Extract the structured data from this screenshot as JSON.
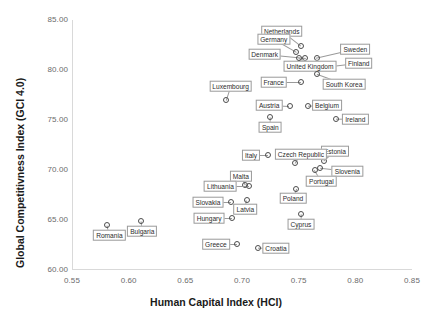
{
  "chart_data": {
    "type": "scatter",
    "title": "",
    "xlabel": "Human Capital Index (HCI)",
    "ylabel": "Global Competitivness Index (GCI 4.0)",
    "xlim": [
      0.55,
      0.85
    ],
    "ylim": [
      60.0,
      85.0
    ],
    "xticks": [
      "0.55",
      "0.60",
      "0.65",
      "0.70",
      "0.75",
      "0.80",
      "0.85"
    ],
    "yticks": [
      "60.00",
      "65.00",
      "70.00",
      "75.00",
      "80.00",
      "85.00"
    ],
    "grid": false,
    "legend": "none",
    "marker": "open-circle",
    "points": [
      {
        "label": "Netherlands",
        "x": 0.752,
        "y": 82.4,
        "lx": 0.735,
        "ly": 83.9
      },
      {
        "label": "Germany",
        "x": 0.748,
        "y": 81.8,
        "lx": 0.728,
        "ly": 83.1
      },
      {
        "label": "Sweden",
        "x": 0.766,
        "y": 81.2,
        "lx": 0.8,
        "ly": 82.1
      },
      {
        "label": "Denmark",
        "x": 0.756,
        "y": 81.2,
        "lx": 0.72,
        "ly": 81.6
      },
      {
        "label": "Finland",
        "x": 0.766,
        "y": 80.2,
        "lx": 0.803,
        "ly": 80.7
      },
      {
        "label": "United Kingdom",
        "x": 0.75,
        "y": 81.2,
        "lx": 0.76,
        "ly": 80.4
      },
      {
        "label": "South Korea",
        "x": 0.766,
        "y": 79.6,
        "lx": 0.79,
        "ly": 78.6
      },
      {
        "label": "France",
        "x": 0.752,
        "y": 78.8,
        "lx": 0.728,
        "ly": 78.8
      },
      {
        "label": "Luxembourg",
        "x": 0.686,
        "y": 77.0,
        "lx": 0.69,
        "ly": 78.4
      },
      {
        "label": "Belgium",
        "x": 0.758,
        "y": 76.4,
        "lx": 0.775,
        "ly": 76.5
      },
      {
        "label": "Austria",
        "x": 0.742,
        "y": 76.4,
        "lx": 0.724,
        "ly": 76.5
      },
      {
        "label": "Ireland",
        "x": 0.783,
        "y": 75.1,
        "lx": 0.8,
        "ly": 75.1
      },
      {
        "label": "Spain",
        "x": 0.725,
        "y": 75.3,
        "lx": 0.725,
        "ly": 74.3
      },
      {
        "label": "Estonia",
        "x": 0.772,
        "y": 70.9,
        "lx": 0.782,
        "ly": 71.9
      },
      {
        "label": "Czech Republic",
        "x": 0.747,
        "y": 70.7,
        "lx": 0.752,
        "ly": 71.6
      },
      {
        "label": "Italy",
        "x": 0.723,
        "y": 71.5,
        "lx": 0.708,
        "ly": 71.5
      },
      {
        "label": "Slovenia",
        "x": 0.769,
        "y": 70.2,
        "lx": 0.793,
        "ly": 69.9
      },
      {
        "label": "Portugal",
        "x": 0.764,
        "y": 70.0,
        "lx": 0.77,
        "ly": 68.9
      },
      {
        "label": "Malta",
        "x": 0.703,
        "y": 68.5,
        "lx": 0.699,
        "ly": 69.4
      },
      {
        "label": "Lithuania",
        "x": 0.706,
        "y": 68.4,
        "lx": 0.681,
        "ly": 68.4
      },
      {
        "label": "Poland",
        "x": 0.748,
        "y": 68.1,
        "lx": 0.745,
        "ly": 67.2
      },
      {
        "label": "Slovakia",
        "x": 0.69,
        "y": 66.8,
        "lx": 0.67,
        "ly": 66.8
      },
      {
        "label": "Latvia",
        "x": 0.704,
        "y": 67.0,
        "lx": 0.703,
        "ly": 66.1
      },
      {
        "label": "Cyprus",
        "x": 0.752,
        "y": 65.6,
        "lx": 0.752,
        "ly": 64.6
      },
      {
        "label": "Hungary",
        "x": 0.691,
        "y": 65.2,
        "lx": 0.671,
        "ly": 65.2
      },
      {
        "label": "Bulgaria",
        "x": 0.611,
        "y": 64.9,
        "lx": 0.612,
        "ly": 63.9
      },
      {
        "label": "Romania",
        "x": 0.581,
        "y": 64.5,
        "lx": 0.583,
        "ly": 63.5
      },
      {
        "label": "Greece",
        "x": 0.696,
        "y": 62.6,
        "lx": 0.677,
        "ly": 62.6
      },
      {
        "label": "Croatia",
        "x": 0.714,
        "y": 62.2,
        "lx": 0.73,
        "ly": 62.2
      }
    ]
  }
}
